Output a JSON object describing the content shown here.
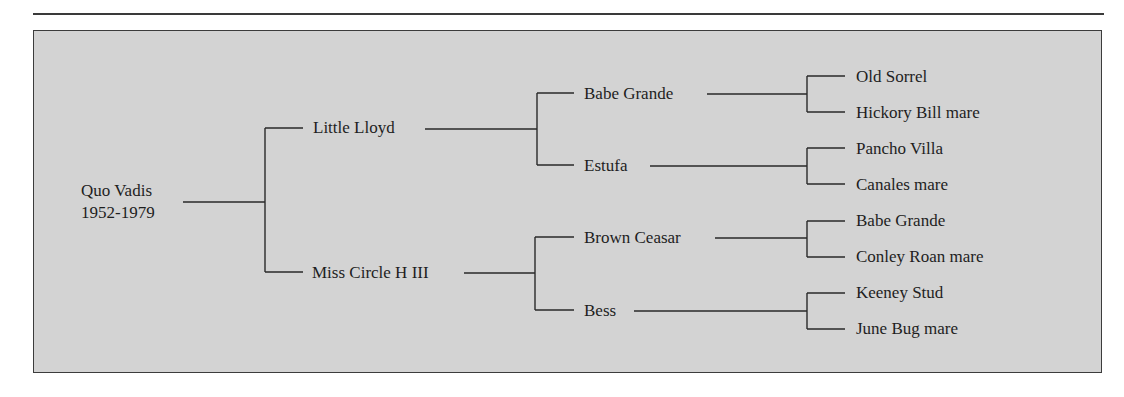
{
  "diagram": {
    "type": "pedigree-chart",
    "root": {
      "name": "Quo Vadis",
      "years": "1952-1979",
      "sire": {
        "name": "Little Lloyd",
        "sire": {
          "name": "Babe Grande",
          "sire": {
            "name": "Old Sorrel"
          },
          "dam": {
            "name": "Hickory Bill mare"
          }
        },
        "dam": {
          "name": "Estufa",
          "sire": {
            "name": "Pancho Villa"
          },
          "dam": {
            "name": "Canales mare"
          }
        }
      },
      "dam": {
        "name": "Miss Circle H III",
        "sire": {
          "name": "Brown Ceasar",
          "sire": {
            "name": "Babe Grande"
          },
          "dam": {
            "name": "Conley Roan mare"
          }
        },
        "dam": {
          "name": "Bess",
          "sire": {
            "name": "Keeney Stud"
          },
          "dam": {
            "name": "June Bug mare"
          }
        }
      }
    }
  },
  "colors": {
    "background": "#d3d3d3",
    "border": "#3c3c3c",
    "line": "#2a2a2a",
    "text": "#1e1e1e"
  }
}
